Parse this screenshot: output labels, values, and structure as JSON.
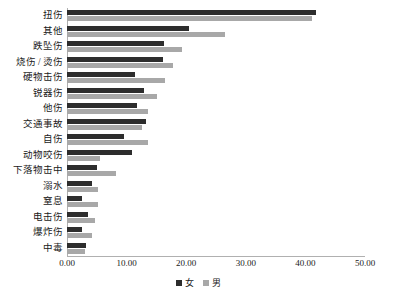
{
  "chart_data": {
    "type": "bar",
    "orientation": "horizontal",
    "title": "",
    "xlabel": "",
    "ylabel": "",
    "xlim": [
      0,
      50
    ],
    "xticks": [
      "0.00",
      "10.00",
      "20.00",
      "30.00",
      "40.00",
      "50.00"
    ],
    "xtick_values": [
      0,
      10,
      20,
      30,
      40,
      50
    ],
    "grid": false,
    "legend_position": "bottom",
    "categories": [
      "扭伤",
      "其他",
      "跌坠伤",
      "烧伤 / 烫伤",
      "硬物击伤",
      "锐器伤",
      "他伤",
      "交通事故",
      "自伤",
      "动物咬伤",
      "下落物击中",
      "溺水",
      "窒息",
      "电击伤",
      "爆炸伤",
      "中毒"
    ],
    "series": [
      {
        "name": "女",
        "color": "#2d2d2d",
        "values": [
          41.8,
          20.5,
          16.3,
          16.1,
          11.4,
          12.9,
          11.7,
          13.3,
          9.6,
          10.9,
          5.0,
          4.2,
          2.5,
          3.5,
          2.5,
          3.2
        ]
      },
      {
        "name": "男",
        "color": "#a8a8a8",
        "values": [
          41.1,
          26.5,
          19.3,
          17.8,
          16.4,
          15.1,
          13.6,
          12.6,
          13.6,
          5.5,
          8.2,
          5.2,
          5.2,
          4.7,
          4.2,
          3.0
        ]
      }
    ]
  },
  "legend": {
    "items": [
      {
        "label": "女",
        "swatch": "female-swatch"
      },
      {
        "label": "男",
        "swatch": "male-swatch"
      }
    ]
  }
}
